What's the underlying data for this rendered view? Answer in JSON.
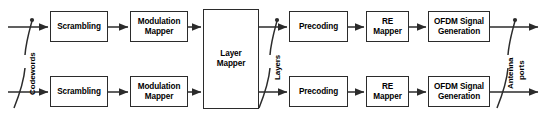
{
  "diagram": {
    "type": "block-flow-diagram",
    "width": 546,
    "height": 121,
    "background_color": "#ffffff",
    "line_color": "#2b2b2b",
    "text_color": "#000000"
  },
  "blocks": [
    {
      "id": "scrambling_top",
      "label": "Scrambling",
      "x": 50,
      "y": 11,
      "w": 58,
      "h": 31
    },
    {
      "id": "modmapper_top",
      "label": "Modulation\nMapper",
      "x": 130,
      "y": 11,
      "w": 58,
      "h": 31
    },
    {
      "id": "layer_mapper",
      "label": "Layer\nMapper",
      "x": 203,
      "y": 9,
      "w": 56,
      "h": 100
    },
    {
      "id": "precoding_top",
      "label": "Precoding",
      "x": 289,
      "y": 11,
      "w": 59,
      "h": 31
    },
    {
      "id": "remapper_top",
      "label": "RE\nMapper",
      "x": 366,
      "y": 11,
      "w": 43,
      "h": 31
    },
    {
      "id": "ofdm_top",
      "label": "OFDM Signal\nGeneration",
      "x": 428,
      "y": 11,
      "w": 62,
      "h": 31
    },
    {
      "id": "scrambling_bot",
      "label": "Scrambling",
      "x": 50,
      "y": 76,
      "w": 58,
      "h": 31
    },
    {
      "id": "modmapper_bot",
      "label": "Modulation\nMapper",
      "x": 130,
      "y": 76,
      "w": 58,
      "h": 31
    },
    {
      "id": "precoding_bot",
      "label": "Precoding",
      "x": 289,
      "y": 76,
      "w": 59,
      "h": 31
    },
    {
      "id": "remapper_bot",
      "label": "RE\nMapper",
      "x": 366,
      "y": 76,
      "w": 43,
      "h": 31
    },
    {
      "id": "ofdm_bot",
      "label": "OFDM Signal\nGeneration",
      "x": 428,
      "y": 76,
      "w": 62,
      "h": 31
    }
  ],
  "labels": {
    "codewords": "Codewords",
    "layers": "Layers",
    "antenna": "Antenna",
    "ports": "ports"
  }
}
